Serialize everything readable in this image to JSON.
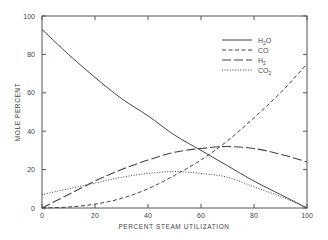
{
  "chart_data": {
    "type": "line",
    "title": "",
    "xlabel": "PERCENT STEAM UTILIZATION",
    "ylabel": "MOLE PERCENT",
    "xlim": [
      0,
      100
    ],
    "ylim": [
      0,
      100
    ],
    "xticks": [
      "0",
      "20",
      "40",
      "60",
      "80",
      "100"
    ],
    "yticks": [
      "0",
      "20",
      "40",
      "60",
      "80",
      "100"
    ],
    "grid": false,
    "legend_position": "upper right",
    "x": [
      0,
      10,
      20,
      30,
      40,
      50,
      60,
      70,
      80,
      90,
      100
    ],
    "series": [
      {
        "name": "H2O",
        "label_main": "H",
        "label_sub": "2",
        "label_tail": "O",
        "style": "solid",
        "values": [
          93,
          80,
          68,
          57,
          48,
          38,
          30,
          22,
          14,
          7,
          0
        ]
      },
      {
        "name": "CO",
        "label_main": "CO",
        "label_sub": "",
        "label_tail": "",
        "style": "dashed",
        "values": [
          0,
          0.5,
          2,
          5,
          10,
          17,
          25,
          35,
          47,
          60,
          75
        ]
      },
      {
        "name": "H2",
        "label_main": "H",
        "label_sub": "2",
        "label_tail": "",
        "style": "long-dash",
        "values": [
          0,
          7,
          14,
          20,
          25,
          29,
          31,
          32,
          31,
          28,
          24
        ]
      },
      {
        "name": "CO2",
        "label_main": "CO",
        "label_sub": "2",
        "label_tail": "",
        "style": "dotted",
        "values": [
          7,
          10,
          13,
          16,
          18,
          19,
          18,
          16,
          11,
          6,
          0
        ]
      }
    ]
  }
}
